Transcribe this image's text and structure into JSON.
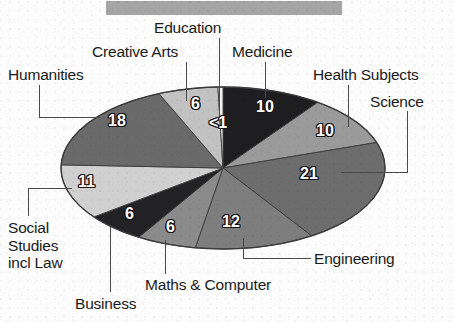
{
  "title_bar": {
    "name": "redacted-title-bar",
    "color": "#9d9d9d",
    "text": ""
  },
  "chart_data": {
    "type": "pie",
    "title": "",
    "subtitle": "",
    "xlabel": "",
    "ylabel": "",
    "legend_position": "callout-labels",
    "grid": false,
    "units": "percent",
    "total": 100,
    "categories": [
      "Medicine",
      "Health Subjects",
      "Science",
      "Engineering",
      "Maths & Computer",
      "Business",
      "Social Studies incl Law",
      "Humanities",
      "Creative Arts",
      "Education"
    ],
    "values": [
      10,
      10,
      21,
      12,
      6,
      6,
      11,
      18,
      6,
      0.5
    ],
    "value_labels": [
      "10",
      "10",
      "21",
      "12",
      "6",
      "6",
      "11",
      "18",
      "6",
      "<1"
    ],
    "slice_colors": [
      "#1e1e20",
      "#9a9a9a",
      "#6d6d6d",
      "#7e7e7e",
      "#8b8b8b",
      "#232326",
      "#d0d0d0",
      "#6a6a6a",
      "#c2c2c2",
      "#f2f2f2"
    ],
    "slices": [
      {
        "label": "Medicine",
        "value": 10,
        "value_label": "10",
        "color": "#1e1e20"
      },
      {
        "label": "Health Subjects",
        "value": 10,
        "value_label": "10",
        "color": "#9a9a9a"
      },
      {
        "label": "Science",
        "value": 21,
        "value_label": "21",
        "color": "#6d6d6d"
      },
      {
        "label": "Engineering",
        "value": 12,
        "value_label": "12",
        "color": "#7e7e7e"
      },
      {
        "label": "Maths & Computer",
        "value": 6,
        "value_label": "6",
        "color": "#8b8b8b"
      },
      {
        "label": "Business",
        "value": 6,
        "value_label": "6",
        "color": "#232326"
      },
      {
        "label": "Social Studies incl Law",
        "value": 11,
        "value_label": "11",
        "color": "#d0d0d0"
      },
      {
        "label": "Humanities",
        "value": 18,
        "value_label": "18",
        "color": "#6a6a6a"
      },
      {
        "label": "Creative Arts",
        "value": 6,
        "value_label": "6",
        "color": "#c2c2c2"
      },
      {
        "label": "Education",
        "value": 0.5,
        "value_label": "<1",
        "color": "#f2f2f2"
      }
    ]
  },
  "callouts": {
    "education": "Education",
    "creative_arts": "Creative Arts",
    "medicine": "Medicine",
    "humanities": "Humanities",
    "health_subjects": "Health Subjects",
    "science": "Science",
    "engineering": "Engineering",
    "maths_computer": "Maths & Computer",
    "business": "Business",
    "social_studies_l1": "Social",
    "social_studies_l2": "Studies",
    "social_studies_l3": "incl Law"
  },
  "values": {
    "medicine": "10",
    "health_subjects": "10",
    "science": "21",
    "engineering": "12",
    "maths_computer": "6",
    "business": "6",
    "social_studies": "11",
    "humanities": "18",
    "creative_arts": "6",
    "education": "<1"
  }
}
